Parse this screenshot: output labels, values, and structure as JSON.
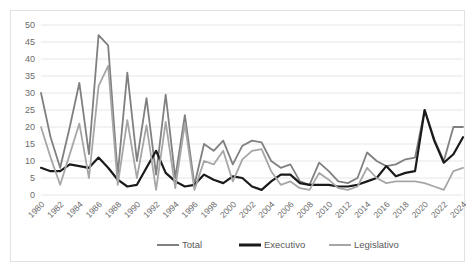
{
  "chart_data": {
    "type": "line",
    "title": "",
    "xlabel": "",
    "ylabel": "",
    "ylim": [
      0,
      50
    ],
    "ytick_step": 5,
    "yticks": [
      "0",
      "5",
      "10",
      "15",
      "20",
      "25",
      "30",
      "35",
      "40",
      "45",
      "50"
    ],
    "grid": true,
    "legend_position": "bottom",
    "x": [
      1980,
      1981,
      1982,
      1983,
      1984,
      1985,
      1986,
      1987,
      1988,
      1989,
      1990,
      1991,
      1992,
      1993,
      1994,
      1995,
      1996,
      1997,
      1998,
      1999,
      2000,
      2001,
      2002,
      2003,
      2004,
      2005,
      2006,
      2007,
      2008,
      2009,
      2010,
      2011,
      2012,
      2013,
      2014,
      2015,
      2016,
      2017,
      2018,
      2019,
      2020,
      2021,
      2022,
      2023,
      2024
    ],
    "xtick_labels": [
      "1980",
      "1982",
      "1984",
      "1986",
      "1988",
      "1990",
      "1992",
      "1994",
      "1996",
      "1998",
      "2000",
      "2002",
      "2004",
      "2006",
      "2008",
      "2010",
      "2012",
      "2014",
      "2016",
      "2018",
      "2020",
      "2022",
      "2024"
    ],
    "xtick_step": 2,
    "series": [
      {
        "name": "Total",
        "color": "#808080",
        "width": 1.8,
        "values": [
          30,
          17,
          8,
          20,
          33,
          12,
          47,
          44,
          6,
          36,
          10,
          28.5,
          6,
          29.5,
          5,
          23.5,
          3,
          15,
          13,
          16,
          9,
          14.5,
          16,
          15.5,
          10,
          8,
          9,
          4,
          3,
          9.5,
          7,
          4,
          3.5,
          5,
          12.5,
          10,
          8.5,
          9,
          10.5,
          11,
          25,
          16.5,
          10,
          20,
          20
        ]
      },
      {
        "name": "Executivo",
        "color": "#1a1a1a",
        "width": 2.2,
        "values": [
          8,
          7,
          7,
          9,
          8.5,
          8,
          11,
          8,
          4.5,
          2.5,
          3,
          8,
          13,
          6.5,
          4,
          2.5,
          3,
          6,
          4.5,
          3.5,
          5.5,
          5,
          2.5,
          1.5,
          4,
          6,
          6,
          3.5,
          3,
          3,
          3,
          2.5,
          2.5,
          3,
          4,
          5,
          8.5,
          5.5,
          6.5,
          7,
          25,
          16,
          9.5,
          12,
          17
        ]
      },
      {
        "name": "Legislativo",
        "color": "#a6a6a6",
        "width": 1.8,
        "values": [
          20,
          11,
          3,
          12,
          21,
          5,
          32,
          38,
          3,
          22,
          5,
          20.5,
          1.5,
          21.5,
          2,
          21,
          1.5,
          10,
          9,
          13,
          4,
          10.5,
          13,
          13.5,
          7,
          3,
          4,
          2,
          1.5,
          6.5,
          4.5,
          2,
          1.5,
          2.5,
          8,
          5,
          3.5,
          4,
          4,
          4,
          3.5,
          2.5,
          1.5,
          7,
          8
        ]
      }
    ]
  },
  "legend": {
    "items": [
      {
        "label": "Total",
        "color": "#808080"
      },
      {
        "label": "Executivo",
        "color": "#1a1a1a"
      },
      {
        "label": "Legislativo",
        "color": "#a6a6a6"
      }
    ]
  }
}
